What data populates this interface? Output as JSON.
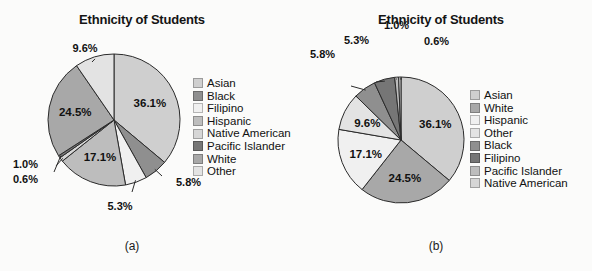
{
  "figure": {
    "background": "#fbfbfa",
    "panels": [
      {
        "id": "panel-a",
        "caption": "(a)",
        "title": "Ethnicity of Students",
        "legend_order": [
          "Asian",
          "Black",
          "Filipino",
          "Hispanic",
          "Native American",
          "Pacific Islander",
          "White",
          "Other"
        ]
      },
      {
        "id": "panel-b",
        "caption": "(b)",
        "title": "Ethnicity of Students",
        "legend_order": [
          "Asian",
          "White",
          "Hispanic",
          "Other",
          "Black",
          "Filipino",
          "Pacific Islander",
          "Native American"
        ]
      }
    ]
  },
  "colors": {
    "asian": "#cfcfcf",
    "black": "#8f8f8f",
    "filipino": "#f0f0f0",
    "hispanic": "#bdbdbd",
    "native_american": "#d6d6d6",
    "pacific_islander": "#767676",
    "white": "#a8a8a8",
    "other": "#e3e3e3",
    "outline": "#2b2b2b",
    "label": "#111111"
  },
  "chart_data": [
    {
      "type": "pie",
      "id": "pie-a",
      "title": "Ethnicity of Students",
      "caption": "(a)",
      "sort": "alphabetical",
      "start_angle_deg": 0,
      "direction": "clockwise",
      "categories": [
        "Asian",
        "Black",
        "Filipino",
        "Hispanic",
        "Native American",
        "Pacific Islander",
        "White",
        "Other"
      ],
      "values": [
        36.1,
        5.8,
        5.3,
        17.1,
        1.0,
        0.6,
        24.5,
        9.6
      ],
      "value_labels": [
        "36.1%",
        "5.8%",
        "5.3%",
        "17.1%",
        "1.0%",
        "0.6%",
        "24.5%",
        "9.6%"
      ],
      "slice_colors": [
        "#cfcfcf",
        "#8f8f8f",
        "#f0f0f0",
        "#bdbdbd",
        "#d6d6d6",
        "#767676",
        "#a8a8a8",
        "#e3e3e3"
      ],
      "label_placement": [
        "inside",
        "callout",
        "callout",
        "inside",
        "callout",
        "callout",
        "inside",
        "callout"
      ],
      "legend": [
        "Asian",
        "Black",
        "Filipino",
        "Hispanic",
        "Native American",
        "Pacific Islander",
        "White",
        "Other"
      ],
      "legend_position": "right",
      "units": "percent"
    },
    {
      "type": "pie",
      "id": "pie-b",
      "title": "Ethnicity of Students",
      "caption": "(b)",
      "sort": "descending",
      "start_angle_deg": 0,
      "direction": "clockwise",
      "categories": [
        "Asian",
        "White",
        "Hispanic",
        "Other",
        "Black",
        "Filipino",
        "Pacific Islander",
        "Native American"
      ],
      "values": [
        36.1,
        24.5,
        17.1,
        9.6,
        5.8,
        5.3,
        1.0,
        0.6
      ],
      "value_labels": [
        "36.1%",
        "24.5%",
        "17.1%",
        "9.6%",
        "5.8%",
        "5.3%",
        "1.0%",
        "0.6%"
      ],
      "slice_colors": [
        "#cfcfcf",
        "#a8a8a8",
        "#f0f0f0",
        "#e3e3e3",
        "#8f8f8f",
        "#767676",
        "#bdbdbd",
        "#d6d6d6"
      ],
      "label_placement": [
        "inside",
        "inside",
        "inside",
        "inside",
        "callout",
        "callout",
        "callout",
        "callout"
      ],
      "legend": [
        "Asian",
        "White",
        "Hispanic",
        "Other",
        "Black",
        "Filipino",
        "Pacific Islander",
        "Native American"
      ],
      "legend_position": "right",
      "units": "percent"
    }
  ]
}
